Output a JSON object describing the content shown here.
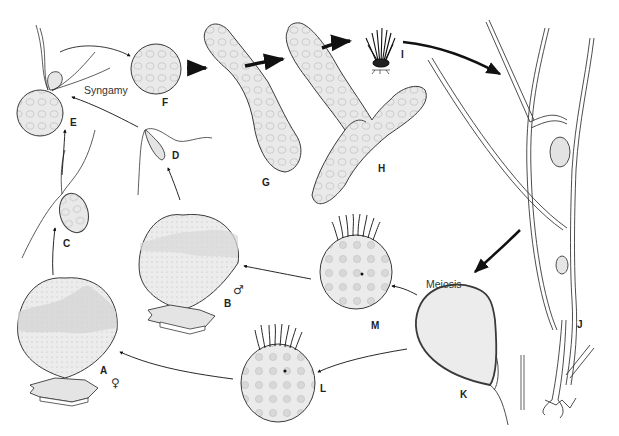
{
  "figure": {
    "type": "life-cycle diagram",
    "colors": {
      "outline": "#3a3a3a",
      "fill": "#e6e6e6",
      "fill_dark": "#cfcfcf",
      "arrow": "#111111",
      "background": "#ffffff"
    }
  },
  "labels": {
    "A": "A",
    "B": "B",
    "C": "C",
    "D": "D",
    "E": "E",
    "F": "F",
    "G": "G",
    "H": "H",
    "I": "I",
    "J": "J",
    "K": "K",
    "L": "L",
    "M": "M"
  },
  "annotations": {
    "syngamy": "Syngamy",
    "meiosis": "Meiosis",
    "female_symbol": "♀",
    "male_symbol": "♂"
  },
  "stages": [
    {
      "id": "A",
      "description": "female gametangium on substrate",
      "symbol": "♀"
    },
    {
      "id": "B",
      "description": "male gametangium on substrate",
      "symbol": "♂"
    },
    {
      "id": "C",
      "description": "female gamete"
    },
    {
      "id": "D",
      "description": "male gamete"
    },
    {
      "id": "E",
      "description": "syngamy"
    },
    {
      "id": "F",
      "description": "zygote"
    },
    {
      "id": "G",
      "description": "germinating zygote"
    },
    {
      "id": "H",
      "description": "branching sporophyte"
    },
    {
      "id": "I",
      "description": "young sporophyte tuft"
    },
    {
      "id": "J",
      "description": "mature branched sporophyte with rhizoids"
    },
    {
      "id": "K",
      "description": "sporangium (meiosis)"
    },
    {
      "id": "L",
      "description": "zoospore"
    },
    {
      "id": "M",
      "description": "zoospore"
    }
  ]
}
